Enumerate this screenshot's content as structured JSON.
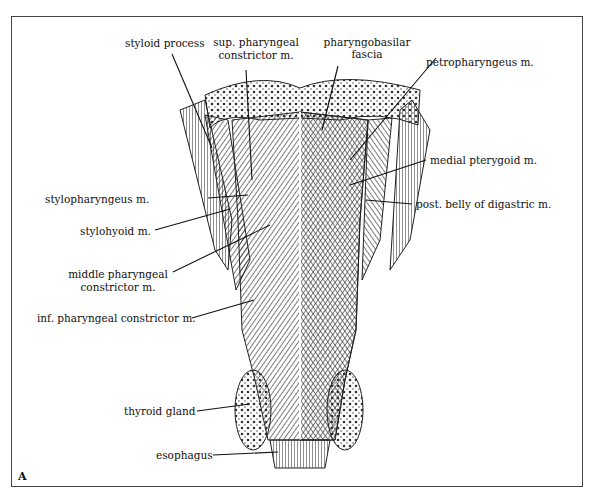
{
  "figure": {
    "panel_letter": "A",
    "labels": {
      "styloid_process": "styloid process",
      "sup_constrictor_1": "sup. pharyngeal",
      "sup_constrictor_2": "constrictor m.",
      "pharyngobasilar_1": "pharyngobasilar",
      "pharyngobasilar_2": "fascia",
      "petropharyngeus": "petropharyngeus m.",
      "medial_pterygoid": "medial pterygoid m.",
      "stylopharyngeus": "stylopharyngeus m.",
      "post_digastric": "post. belly of digastric m.",
      "stylohyoid": "stylohyoid m.",
      "middle_constrictor_1": "middle pharyngeal",
      "middle_constrictor_2": "constrictor m.",
      "inf_constrictor": "inf. pharyngeal constrictor m.",
      "thyroid_gland": "thyroid gland",
      "esophagus": "esophagus"
    }
  }
}
